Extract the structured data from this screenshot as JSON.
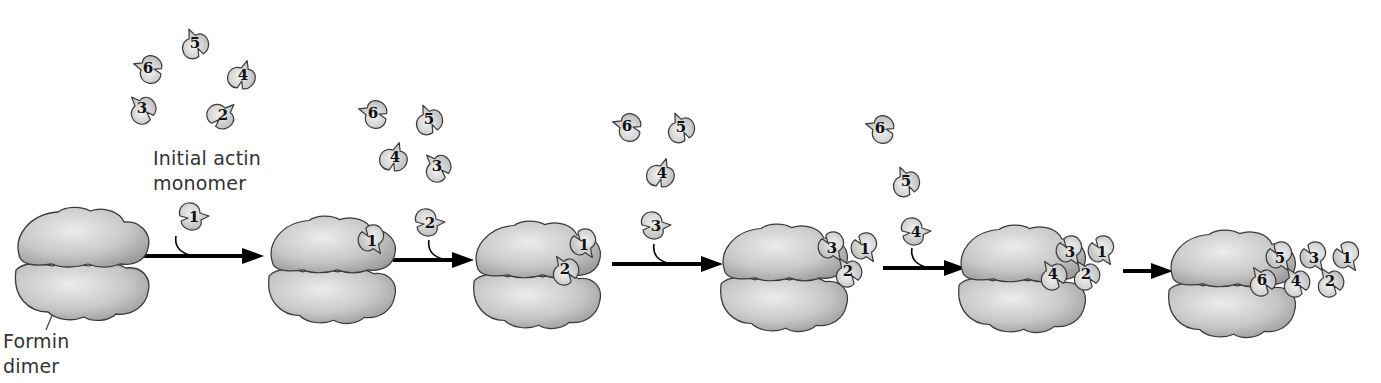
{
  "diagram": {
    "colors": {
      "formin_light": "#e6e6e6",
      "formin_dark": "#9e9e9e",
      "monomer_light": "#ececec",
      "monomer_dark": "#b8b8b8",
      "outline": "#3a3a3a",
      "arrow": "#000000",
      "text": "#333333"
    },
    "labels": {
      "initial_monomer": {
        "line1": "Initial actin",
        "line2": "monomer"
      },
      "formin": {
        "line1": "Formin",
        "line2": "dimer"
      }
    },
    "stages": [
      {
        "id": "stage-1",
        "formin": {
          "x": 80,
          "y": 262,
          "scale": 1.0
        },
        "bound": [],
        "free": [
          {
            "n": "5",
            "x": 195,
            "y": 43,
            "rot": 250
          },
          {
            "n": "6",
            "x": 148,
            "y": 68,
            "rot": 200
          },
          {
            "n": "4",
            "x": 243,
            "y": 75,
            "rot": 290
          },
          {
            "n": "3",
            "x": 142,
            "y": 108,
            "rot": 230
          },
          {
            "n": "2",
            "x": 223,
            "y": 115,
            "rot": 320
          }
        ],
        "incoming": {
          "n": "1",
          "x": 194,
          "y": 217,
          "rot": 0
        }
      },
      {
        "id": "stage-2",
        "formin": {
          "x": 330,
          "y": 268,
          "scale": 0.95
        },
        "bound": [
          {
            "n": "1",
            "x": 372,
            "y": 241,
            "rot": 60
          }
        ],
        "free": [
          {
            "n": "6",
            "x": 373,
            "y": 113,
            "rot": 200
          },
          {
            "n": "5",
            "x": 429,
            "y": 119,
            "rot": 250
          },
          {
            "n": "4",
            "x": 395,
            "y": 157,
            "rot": 290
          },
          {
            "n": "3",
            "x": 437,
            "y": 166,
            "rot": 230
          }
        ],
        "incoming": {
          "n": "2",
          "x": 430,
          "y": 223,
          "rot": 0
        }
      },
      {
        "id": "stage-3",
        "formin": {
          "x": 535,
          "y": 273,
          "scale": 0.95
        },
        "bound": [
          {
            "n": "1",
            "x": 584,
            "y": 245,
            "rot": 60
          },
          {
            "n": "2",
            "x": 565,
            "y": 269,
            "rot": 240
          }
        ],
        "free": [
          {
            "n": "6",
            "x": 627,
            "y": 126,
            "rot": 200
          },
          {
            "n": "5",
            "x": 681,
            "y": 127,
            "rot": 250
          },
          {
            "n": "4",
            "x": 662,
            "y": 173,
            "rot": 290
          }
        ],
        "incoming": {
          "n": "3",
          "x": 656,
          "y": 226,
          "rot": 0
        }
      },
      {
        "id": "stage-4",
        "formin": {
          "x": 782,
          "y": 276,
          "scale": 0.95
        },
        "bound": [
          {
            "n": "1",
            "x": 865,
            "y": 249,
            "rot": 60
          },
          {
            "n": "3",
            "x": 832,
            "y": 248,
            "rot": 60
          },
          {
            "n": "2",
            "x": 848,
            "y": 271,
            "rot": 240
          }
        ],
        "free": [
          {
            "n": "6",
            "x": 880,
            "y": 128,
            "rot": 200
          },
          {
            "n": "5",
            "x": 906,
            "y": 181,
            "rot": 250
          }
        ],
        "incoming": {
          "n": "4",
          "x": 916,
          "y": 232,
          "rot": 0
        }
      },
      {
        "id": "stage-5",
        "formin": {
          "x": 1020,
          "y": 277,
          "scale": 0.95
        },
        "bound": [
          {
            "n": "1",
            "x": 1102,
            "y": 252,
            "rot": 60
          },
          {
            "n": "3",
            "x": 1070,
            "y": 252,
            "rot": 60
          },
          {
            "n": "2",
            "x": 1086,
            "y": 274,
            "rot": 240
          },
          {
            "n": "4",
            "x": 1053,
            "y": 274,
            "rot": 240
          }
        ],
        "free": [],
        "incoming": null
      },
      {
        "id": "stage-6",
        "formin": {
          "x": 1230,
          "y": 282,
          "scale": 0.95
        },
        "bound": [
          {
            "n": "1",
            "x": 1347,
            "y": 258,
            "rot": 60
          },
          {
            "n": "3",
            "x": 1314,
            "y": 258,
            "rot": 60
          },
          {
            "n": "5",
            "x": 1280,
            "y": 258,
            "rot": 60
          },
          {
            "n": "2",
            "x": 1330,
            "y": 281,
            "rot": 240
          },
          {
            "n": "4",
            "x": 1296,
            "y": 281,
            "rot": 240
          },
          {
            "n": "6",
            "x": 1262,
            "y": 280,
            "rot": 240
          }
        ],
        "free": [],
        "incoming": null
      }
    ],
    "arrows": [
      {
        "x1": 140,
        "x2": 264,
        "y": 256,
        "hook": true,
        "hx": 176
      },
      {
        "x1": 393,
        "x2": 474,
        "y": 260,
        "hook": true,
        "hx": 429
      },
      {
        "x1": 612,
        "x2": 723,
        "y": 264,
        "hook": true,
        "hx": 654
      },
      {
        "x1": 883,
        "x2": 966,
        "y": 268,
        "hook": true,
        "hx": 912
      },
      {
        "x1": 1123,
        "x2": 1173,
        "y": 271,
        "hook": false,
        "hx": 0
      }
    ],
    "formin_pointer": {
      "x1": 60,
      "y1": 296,
      "x2": 46,
      "y2": 330
    }
  }
}
